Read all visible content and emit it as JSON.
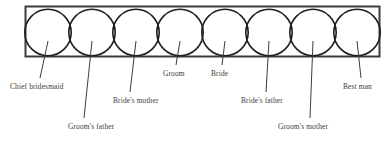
{
  "diagram": {
    "canvas": {
      "width": 390,
      "height": 144,
      "background": "#ffffff"
    },
    "frame": {
      "name": "receiving-line-frame",
      "x": 25.5,
      "y": 6.5,
      "width": 354,
      "height": 50,
      "stroke": "#3c3c3c",
      "stroke_width": 2,
      "fill": "none"
    },
    "circle_style": {
      "radius": 23.2,
      "center_y": 32.5,
      "stroke": "#1f1f1f",
      "stroke_width": 1.6,
      "fill": "none"
    },
    "leader_style": {
      "stroke": "#3c3c3c",
      "stroke_width": 1
    },
    "people": [
      {
        "id": "chief-bridesmaid",
        "label": "Chief bridesmaid",
        "circle_cx": 48,
        "leader_x1": 48,
        "leader_y1": 41,
        "leader_x2": 40,
        "leader_y2": 78,
        "text_x": 10,
        "text_y": 89,
        "anchor": "start"
      },
      {
        "id": "grooms-father",
        "label": "Groom's father",
        "circle_cx": 92,
        "leader_x1": 92,
        "leader_y1": 41,
        "leader_x2": 84,
        "leader_y2": 118,
        "text_x": 68,
        "text_y": 129,
        "anchor": "start"
      },
      {
        "id": "brides-mother",
        "label": "Bride's mother",
        "circle_cx": 136,
        "leader_x1": 136,
        "leader_y1": 41,
        "leader_x2": 130,
        "leader_y2": 92,
        "text_x": 113,
        "text_y": 103,
        "anchor": "start"
      },
      {
        "id": "groom",
        "label": "Groom",
        "circle_cx": 180,
        "leader_x1": 180,
        "leader_y1": 41,
        "leader_x2": 176,
        "leader_y2": 65,
        "text_x": 163,
        "text_y": 76,
        "anchor": "start"
      },
      {
        "id": "bride",
        "label": "Bride",
        "circle_cx": 225,
        "leader_x1": 225,
        "leader_y1": 41,
        "leader_x2": 222,
        "leader_y2": 65,
        "text_x": 211,
        "text_y": 76,
        "anchor": "start"
      },
      {
        "id": "brides-father",
        "label": "Bride's father",
        "circle_cx": 269,
        "leader_x1": 269,
        "leader_y1": 41,
        "leader_x2": 266,
        "leader_y2": 92,
        "text_x": 241,
        "text_y": 103,
        "anchor": "start"
      },
      {
        "id": "grooms-mother",
        "label": "Groom's mother",
        "circle_cx": 313,
        "leader_x1": 313,
        "leader_y1": 41,
        "leader_x2": 310,
        "leader_y2": 118,
        "text_x": 278,
        "text_y": 129,
        "anchor": "start"
      },
      {
        "id": "best-man",
        "label": "Best man",
        "circle_cx": 357,
        "leader_x1": 357,
        "leader_y1": 41,
        "leader_x2": 361,
        "leader_y2": 78,
        "text_x": 343,
        "text_y": 89,
        "anchor": "start"
      }
    ]
  }
}
